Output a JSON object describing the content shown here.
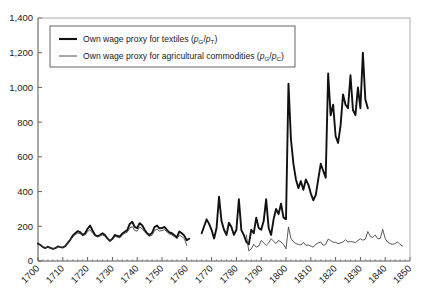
{
  "chart_data": {
    "type": "line",
    "title": "",
    "xlabel": "",
    "ylabel": "",
    "xlim": [
      1700,
      1850
    ],
    "ylim": [
      0,
      1400
    ],
    "ytick_step": 200,
    "xtick_step": 10,
    "grid": false,
    "legend_position": "top-left",
    "ytick_labels": [
      "0",
      "200",
      "400",
      "600",
      "800",
      "1,000",
      "1,200",
      "1,400"
    ],
    "ytick_values": [
      0,
      200,
      400,
      600,
      800,
      1000,
      1200,
      1400
    ],
    "xtick_labels": [
      "1700",
      "1710",
      "1720",
      "1730",
      "1740",
      "1750",
      "1760",
      "1770",
      "1780",
      "1790",
      "1800",
      "1810",
      "1820",
      "1830",
      "1840",
      "1850"
    ],
    "xtick_values": [
      1700,
      1710,
      1720,
      1730,
      1740,
      1750,
      1760,
      1770,
      1780,
      1790,
      1800,
      1810,
      1820,
      1830,
      1840,
      1850
    ],
    "series": [
      {
        "name": "Own wage proxy for textiles (pG/pT)",
        "label_main": "Own wage proxy for textiles (",
        "label_num": "p",
        "label_num_sub": "G",
        "label_sep": "/",
        "label_den": "p",
        "label_den_sub": "T",
        "label_close": ")",
        "color": "#111111",
        "width": 1.9,
        "x": [
          1700,
          1701,
          1702,
          1703,
          1704,
          1705,
          1706,
          1707,
          1708,
          1709,
          1710,
          1711,
          1712,
          1713,
          1714,
          1715,
          1716,
          1717,
          1718,
          1719,
          1720,
          1721,
          1722,
          1723,
          1724,
          1725,
          1726,
          1727,
          1728,
          1729,
          1730,
          1731,
          1732,
          1733,
          1734,
          1735,
          1736,
          1737,
          1738,
          1739,
          1740,
          1741,
          1742,
          1743,
          1744,
          1745,
          1746,
          1747,
          1748,
          1749,
          1750,
          1751,
          1752,
          1753,
          1754,
          1755,
          1756,
          1757,
          1758,
          1759,
          1760,
          1761
        ],
        "values": [
          100,
          92,
          80,
          75,
          82,
          76,
          70,
          74,
          84,
          80,
          78,
          86,
          104,
          122,
          146,
          160,
          172,
          166,
          150,
          160,
          186,
          204,
          176,
          150,
          142,
          150,
          160,
          150,
          130,
          116,
          128,
          150,
          144,
          140,
          158,
          168,
          178,
          214,
          226,
          196,
          190,
          218,
          206,
          180,
          160,
          150,
          162,
          196,
          204,
          188,
          190,
          196,
          180,
          164,
          160,
          148,
          136,
          170,
          160,
          146,
          120,
          128
        ],
        "x2": [
          1766,
          1767,
          1768,
          1769,
          1770,
          1771,
          1772,
          1773,
          1774,
          1775,
          1776,
          1777,
          1778,
          1779,
          1780,
          1781,
          1782,
          1783,
          1784,
          1785,
          1786,
          1787,
          1788,
          1789,
          1790,
          1791,
          1792,
          1793,
          1794,
          1795,
          1796,
          1797,
          1798,
          1799,
          1800,
          1801,
          1802,
          1803,
          1804,
          1805,
          1806,
          1807,
          1808,
          1809,
          1810,
          1811,
          1812,
          1813,
          1814,
          1815,
          1816,
          1817,
          1818,
          1819,
          1820,
          1821,
          1822,
          1823,
          1824,
          1825,
          1826,
          1827,
          1828,
          1829,
          1830,
          1831,
          1832,
          1833,
          1834,
          1835,
          1836,
          1837,
          1838,
          1839,
          1840,
          1841,
          1842,
          1843,
          1844,
          1845,
          1846,
          1847,
          1848,
          1849,
          1850
        ],
        "values2": [
          160,
          200,
          240,
          214,
          178,
          130,
          190,
          370,
          230,
          180,
          150,
          220,
          196,
          150,
          180,
          356,
          178,
          150,
          110,
          96,
          180,
          160,
          250,
          190,
          180,
          230,
          356,
          190,
          150,
          240,
          300,
          270,
          330,
          250,
          240,
          1022,
          700,
          560,
          470,
          420,
          460,
          410,
          470,
          440,
          390,
          350,
          380,
          470,
          560,
          520,
          480,
          1080,
          840,
          900,
          720,
          680,
          780,
          960,
          900,
          880,
          1070,
          870,
          840,
          1000,
          880,
          1200,
          930,
          880
        ],
        "gap_note": "series breaks between 1761 and 1766"
      },
      {
        "name": "Own wage proxy for agricultural commodities (pG/pC)",
        "label_main": "Own wage proxy for agricultural commodities (",
        "label_num": "p",
        "label_num_sub": "G",
        "label_sep": "/",
        "label_den": "p",
        "label_den_sub": "C",
        "label_close": ")",
        "color": "#3a3a3a",
        "width": 0.85,
        "x": [
          1700,
          1701,
          1702,
          1703,
          1704,
          1705,
          1706,
          1707,
          1708,
          1709,
          1710,
          1711,
          1712,
          1713,
          1714,
          1715,
          1716,
          1717,
          1718,
          1719,
          1720,
          1721,
          1722,
          1723,
          1724,
          1725,
          1726,
          1727,
          1728,
          1729,
          1730,
          1731,
          1732,
          1733,
          1734,
          1735,
          1736,
          1737,
          1738,
          1739,
          1740,
          1741,
          1742,
          1743,
          1744,
          1745,
          1746,
          1747,
          1748,
          1749,
          1750,
          1751,
          1752,
          1753,
          1754,
          1755,
          1756,
          1757,
          1758,
          1759,
          1760
        ],
        "values": [
          100,
          92,
          80,
          75,
          82,
          76,
          70,
          74,
          84,
          80,
          78,
          86,
          104,
          122,
          140,
          152,
          160,
          158,
          146,
          150,
          170,
          180,
          160,
          146,
          140,
          144,
          150,
          142,
          128,
          114,
          124,
          142,
          138,
          134,
          150,
          160,
          166,
          190,
          198,
          176,
          172,
          196,
          186,
          168,
          152,
          142,
          150,
          176,
          184,
          172,
          176,
          180,
          168,
          156,
          150,
          140,
          128,
          150,
          140,
          130,
          90
        ],
        "x2": [
          1784,
          1785,
          1786,
          1787,
          1788,
          1789,
          1790,
          1791,
          1792,
          1793,
          1794,
          1795,
          1796,
          1797,
          1798,
          1799,
          1800,
          1801,
          1802,
          1803,
          1804,
          1805,
          1806,
          1807,
          1808,
          1809,
          1810,
          1811,
          1812,
          1813,
          1814,
          1815,
          1816,
          1817,
          1818,
          1819,
          1820,
          1821,
          1822,
          1823,
          1824,
          1825,
          1826,
          1827,
          1828,
          1829,
          1830,
          1831,
          1832,
          1833,
          1834,
          1835,
          1836,
          1837,
          1838,
          1839,
          1840,
          1841,
          1842,
          1843,
          1844,
          1845,
          1846,
          1847,
          1848,
          1849,
          1850
        ],
        "values2": [
          150,
          58,
          70,
          96,
          80,
          86,
          118,
          104,
          90,
          104,
          128,
          114,
          100,
          118,
          110,
          96,
          70,
          196,
          130,
          110,
          100,
          96,
          92,
          108,
          90,
          92,
          86,
          80,
          96,
          104,
          110,
          90,
          96,
          126,
          118,
          108,
          108,
          100,
          104,
          110,
          122,
          110,
          112,
          110,
          106,
          118,
          128,
          120,
          126,
          170,
          142,
          136,
          150,
          128,
          130,
          182,
          130,
          108,
          100,
          96,
          100,
          110,
          95,
          86
        ],
        "gap_note": "series breaks between 1760 and 1784"
      }
    ]
  },
  "axes": {
    "y_axis_name": "value-axis",
    "x_axis_name": "year-axis"
  }
}
